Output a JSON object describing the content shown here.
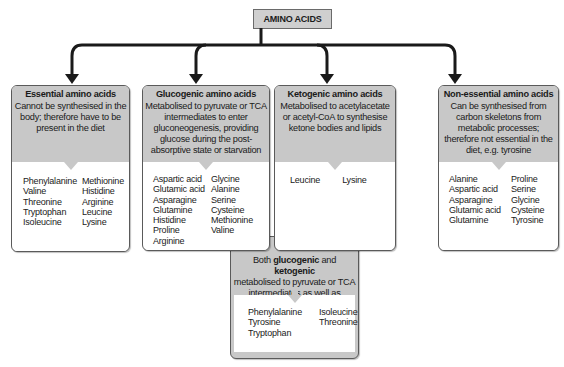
{
  "root": {
    "label": "AMINO ACIDS"
  },
  "colors": {
    "header_gray": "#c8c8c8",
    "border": "#5a5a5a",
    "arrow": "#1a1a1a"
  },
  "categories": [
    {
      "id": "essential",
      "title": "Essential amino acids",
      "description": "Cannot be synthesised in the body; therefore have to be present in the diet",
      "columns": [
        [
          "Phenylalanine",
          "Valine",
          "Threonine",
          "Tryptophan",
          "Isoleucine"
        ],
        [
          "Methionine",
          "Histidine",
          "Arginine",
          "Leucine",
          "Lysine"
        ]
      ]
    },
    {
      "id": "glucogenic",
      "title": "Glucogenic amino acids",
      "description": "Metabolised to pyruvate or TCA intermediates to enter gluconeogenesis, providing glucose during the post-absorptive state or starvation",
      "columns": [
        [
          "Aspartic acid",
          "Glutamic acid",
          "Asparagine",
          "Glutamine",
          "Histidine",
          "Proline",
          "Arginine"
        ],
        [
          "Glycine",
          "Alanine",
          "Serine",
          "Cysteine",
          "Methionine",
          "Valine"
        ]
      ]
    },
    {
      "id": "ketogenic",
      "title": "Ketogenic amino acids",
      "description": "Metabolised to acetylacetate or acetyl-CoA to synthesise ketone bodies and lipids",
      "columns": [
        [
          "Leucine"
        ],
        [
          "Lysine"
        ]
      ]
    },
    {
      "id": "non-essential",
      "title": "Non-essential amino acids",
      "description": "Can be synthesised from carbon skeletons from metabolic processes; therefore not essential in the diet, e.g. tyrosine",
      "columns": [
        [
          "Alanine",
          "Aspartic acid",
          "Asparagine",
          "Glutamic acid",
          "Glutamine"
        ],
        [
          "Proline",
          "Serine",
          "Glycine",
          "Cysteine",
          "Tyrosine"
        ]
      ]
    }
  ],
  "both": {
    "prefix": "Both ",
    "bold1": "glucogenic",
    "mid": " and ",
    "bold2": "ketogenic",
    "description": "metabolised to pyruvate or TCA intermediates as well as acetylacetate or acetyl-CoA",
    "columns": [
      [
        "Phenylalanine",
        "Tyrosine",
        "Tryptophan"
      ],
      [
        "Isoleucine",
        "Threonine"
      ]
    ]
  }
}
